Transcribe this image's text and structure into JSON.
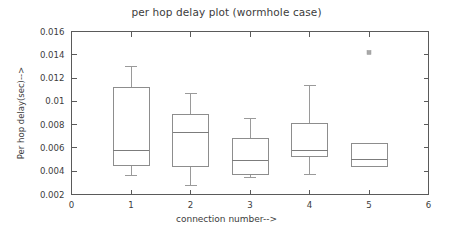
{
  "chart_data": {
    "type": "box",
    "title": "per hop delay plot (wormhole case)",
    "xlabel": "connection number-->",
    "ylabel": "Per hop delay(sec)-->",
    "xlim": [
      0,
      6
    ],
    "ylim": [
      0.002,
      0.016
    ],
    "grid": false,
    "legend": null,
    "x_ticks": [
      "0",
      "1",
      "2",
      "3",
      "4",
      "5",
      "6"
    ],
    "x_tick_values": [
      0,
      1,
      2,
      3,
      4,
      5,
      6
    ],
    "y_ticks": [
      "0.002",
      "0.004",
      "0.006",
      "0.008",
      "0.01",
      "0.012",
      "0.014",
      "0.016"
    ],
    "y_tick_values": [
      0.002,
      0.004,
      0.006,
      0.008,
      0.01,
      0.012,
      0.014,
      0.016
    ],
    "categories": [
      "1",
      "2",
      "3",
      "4",
      "5"
    ],
    "boxes": [
      {
        "category": "1",
        "x": 1,
        "whisker_low": 0.0036,
        "q1": 0.0045,
        "median": 0.0058,
        "q3": 0.0112,
        "whisker_high": 0.013,
        "outliers": []
      },
      {
        "category": "2",
        "x": 2,
        "whisker_low": 0.0028,
        "q1": 0.0044,
        "median": 0.0073,
        "q3": 0.0089,
        "whisker_high": 0.0107,
        "outliers": []
      },
      {
        "category": "3",
        "x": 3,
        "whisker_low": 0.0035,
        "q1": 0.0037,
        "median": 0.0049,
        "q3": 0.0068,
        "whisker_high": 0.0085,
        "outliers": []
      },
      {
        "category": "4",
        "x": 4,
        "whisker_low": 0.0037,
        "q1": 0.0053,
        "median": 0.0058,
        "q3": 0.0081,
        "whisker_high": 0.0114,
        "outliers": []
      },
      {
        "category": "5",
        "x": 5,
        "whisker_low": 0.0044,
        "q1": 0.0044,
        "median": 0.005,
        "q3": 0.0064,
        "whisker_high": 0.0064,
        "outliers": [
          0.0142
        ]
      }
    ],
    "colors": {
      "background": "#ffffff",
      "axis": "#5a5a5a",
      "box_stroke": "#8d8d8d",
      "median": "#7c7c7c",
      "whisker": "#9a9a9a",
      "outlier": "#a8a8a8",
      "text": "#3c3c3c"
    }
  }
}
